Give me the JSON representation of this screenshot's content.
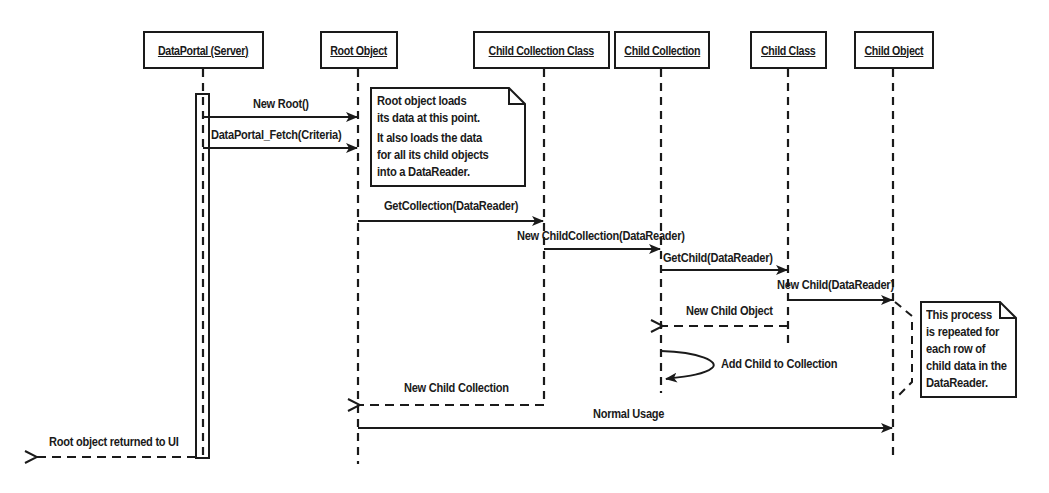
{
  "diagram": {
    "type": "sequence",
    "objects": [
      {
        "label": "DataPortal (Server)"
      },
      {
        "label": "Root Object"
      },
      {
        "label": "Child Collection Class"
      },
      {
        "label": "Child Collection"
      },
      {
        "label": "Child Class"
      },
      {
        "label": "Child Object"
      }
    ],
    "messages": [
      {
        "label": "New Root()",
        "from": "DataPortal (Server)",
        "to": "Root Object",
        "kind": "call"
      },
      {
        "label": "DataPortal_Fetch(Criteria)",
        "from": "DataPortal (Server)",
        "to": "Root Object",
        "kind": "call"
      },
      {
        "label": "GetCollection(DataReader)",
        "from": "Root Object",
        "to": "Child Collection Class",
        "kind": "call"
      },
      {
        "label": "New ChildCollection(DataReader)",
        "from": "Child Collection Class",
        "to": "Child Collection",
        "kind": "call"
      },
      {
        "label": "GetChild(DataReader)",
        "from": "Child Collection",
        "to": "Child Class",
        "kind": "call"
      },
      {
        "label": "New Child(DataReader)",
        "from": "Child Class",
        "to": "Child Object",
        "kind": "call"
      },
      {
        "label": "New Child Object",
        "from": "Child Class",
        "to": "Child Collection",
        "kind": "return"
      },
      {
        "label": "Add Child to Collection",
        "from": "Child Collection",
        "to": "Child Collection",
        "kind": "self"
      },
      {
        "label": "New Child Collection",
        "from": "Child Collection Class",
        "to": "Root Object",
        "kind": "return"
      },
      {
        "label": "Normal Usage",
        "from": "Root Object",
        "to": "Child Object",
        "kind": "call"
      },
      {
        "label": "Root object returned to UI",
        "from": "DataPortal (Server)",
        "to": "UI",
        "kind": "return"
      }
    ],
    "notes": [
      {
        "lines": [
          "Root object loads",
          "its data at this point.",
          "It also loads the data",
          "for all its child objects",
          "into a DataReader."
        ]
      },
      {
        "lines": [
          "This process",
          "is repeated for",
          "each row of",
          "child data in the",
          "DataReader."
        ]
      }
    ]
  }
}
